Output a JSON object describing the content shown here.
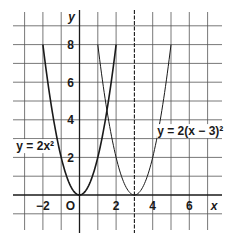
{
  "chart_data": {
    "type": "line",
    "title": "",
    "xlabel": "x",
    "ylabel": "y",
    "xlim": [
      -3.7,
      7.8
    ],
    "ylim": [
      -1.8,
      9.7
    ],
    "grid": true,
    "x_ticks": [
      {
        "value": -2,
        "label": "−2"
      },
      {
        "value": 0,
        "label": "O"
      },
      {
        "value": 2,
        "label": "2"
      },
      {
        "value": 4,
        "label": "4"
      },
      {
        "value": 6,
        "label": "6"
      }
    ],
    "y_ticks": [
      {
        "value": 2,
        "label": "2"
      },
      {
        "value": 4,
        "label": "4"
      },
      {
        "value": 6,
        "label": "6"
      },
      {
        "value": 8,
        "label": "8"
      }
    ],
    "series": [
      {
        "name": "y = 2x²",
        "label": "y = 2x²",
        "equation": "2*x^2",
        "x_range": [
          -2,
          2
        ],
        "x": [
          -2,
          -1.5,
          -1,
          -0.5,
          0,
          0.5,
          1,
          1.5,
          2
        ],
        "y": [
          8,
          4.5,
          2,
          0.5,
          0,
          0.5,
          2,
          4.5,
          8
        ],
        "stroke_width": 1.6,
        "label_pos": {
          "x": -3.45,
          "y": 2.6
        }
      },
      {
        "name": "y = 2(x − 3)²",
        "label": "y = 2(x − 3)²",
        "equation": "2*(x-3)^2",
        "x_range": [
          1,
          5
        ],
        "x": [
          1,
          1.5,
          2,
          2.5,
          3,
          3.5,
          4,
          4.5,
          5
        ],
        "y": [
          8,
          4.5,
          2,
          0.5,
          0,
          0.5,
          2,
          4.5,
          8
        ],
        "stroke_width": 1.0,
        "label_pos": {
          "x": 4.25,
          "y": 3.4
        }
      }
    ],
    "annotations": [
      {
        "type": "dashed-vertical-line",
        "x": 3
      }
    ]
  },
  "colors": {
    "grid": "#555555",
    "axis": "#1a1a1a",
    "curve": "#1a1a1a",
    "background": "#ffffff"
  }
}
